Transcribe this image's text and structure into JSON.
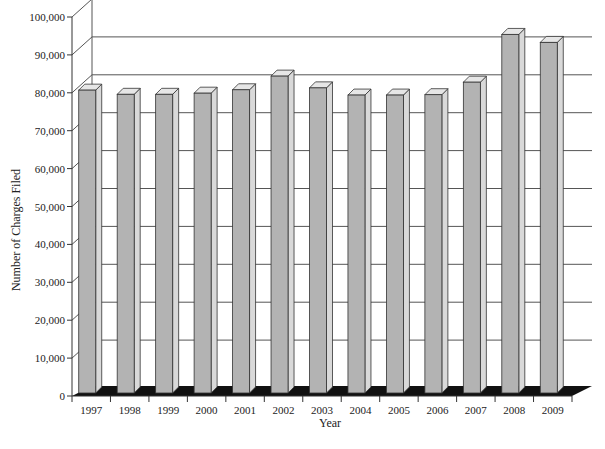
{
  "chart_data": {
    "type": "bar",
    "style": "3d-column",
    "title": "",
    "xlabel": "Year",
    "ylabel": "Number of Charges Filed",
    "categories": [
      "1997",
      "1998",
      "1999",
      "2000",
      "2001",
      "2002",
      "2003",
      "2004",
      "2005",
      "2006",
      "2007",
      "2008",
      "2009"
    ],
    "values": [
      80700,
      79600,
      79600,
      79900,
      80800,
      84400,
      81300,
      79400,
      79400,
      79500,
      82800,
      95400,
      93300
    ],
    "ylim": [
      0,
      100000
    ],
    "yticks": [
      0,
      10000,
      20000,
      30000,
      40000,
      50000,
      60000,
      70000,
      80000,
      90000,
      100000
    ],
    "ytick_labels": [
      "0",
      "10,000",
      "20,000",
      "30,000",
      "40,000",
      "50,000",
      "60,000",
      "70,000",
      "80,000",
      "90,000",
      "100,000"
    ],
    "grid": true,
    "legend": null,
    "colors": {
      "bar_front": "#b3b3b3",
      "bar_side": "#d9d9d9",
      "bar_top": "#e6e6e6",
      "floor": "#111111",
      "grid": "#555555",
      "axis": "#333333"
    }
  }
}
